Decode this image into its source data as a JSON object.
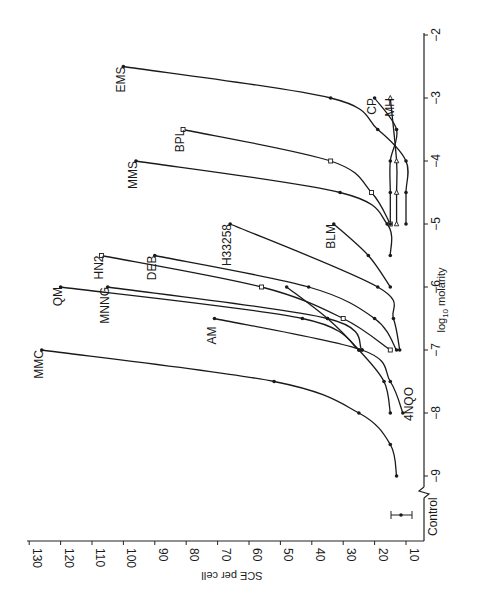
{
  "chart_data": {
    "type": "line",
    "orientation": "rotated-90-clockwise",
    "title": "",
    "xlabel": "log10 molarity",
    "ylabel": "SCE per cell",
    "xlim": [
      -9,
      -2
    ],
    "ylim": [
      0,
      130
    ],
    "x_ticks": [
      -9,
      -8,
      -7,
      -6,
      -5,
      -4,
      -3,
      -2
    ],
    "x_tick_labels": [
      "−9",
      "−8",
      "−7",
      "−6",
      "−5",
      "−4",
      "−3",
      "−2"
    ],
    "y_ticks": [
      10,
      20,
      30,
      40,
      50,
      60,
      70,
      80,
      90,
      100,
      110,
      120,
      130
    ],
    "y_tick_labels": [
      "10",
      "20",
      "30",
      "40",
      "50",
      "60",
      "70",
      "80",
      "90",
      "100",
      "110",
      "120",
      "130"
    ],
    "grid": false,
    "axis_break": "between Control and −9",
    "control": {
      "label": "Control",
      "value": 11.5,
      "error": 5
    },
    "series": [
      {
        "name": "MMC",
        "marker": "filled",
        "x": [
          -9,
          -8.5,
          -8,
          -7.5,
          -7
        ],
        "y": [
          13,
          15,
          25,
          52,
          126
        ]
      },
      {
        "name": "4NQO",
        "marker": "filled",
        "x": [
          -8,
          -7.5,
          -7,
          -6.5,
          -6
        ],
        "y": [
          15,
          17,
          25,
          35,
          48
        ]
      },
      {
        "name": "AM",
        "marker": "filled",
        "x": [
          -8,
          -7.5,
          -7,
          -6.5
        ],
        "y": [
          11,
          15,
          24,
          71
        ]
      },
      {
        "name": "QM",
        "marker": "filled",
        "x": [
          -7,
          -6.5,
          -6
        ],
        "y": [
          25,
          43,
          120
        ]
      },
      {
        "name": "MNNG",
        "marker": "filled",
        "x": [
          -7,
          -6.5,
          -6
        ],
        "y": [
          24,
          35,
          105
        ]
      },
      {
        "name": "HN2",
        "marker": "open-square",
        "x": [
          -7,
          -6.5,
          -6,
          -5.5
        ],
        "y": [
          15,
          30,
          56,
          107
        ]
      },
      {
        "name": "DEB",
        "marker": "filled",
        "x": [
          -7,
          -6.5,
          -6,
          -5.5
        ],
        "y": [
          13,
          20,
          41,
          90
        ]
      },
      {
        "name": "H33258",
        "marker": "filled",
        "x": [
          -7,
          -6.5,
          -6,
          -5
        ],
        "y": [
          12,
          14,
          19,
          66
        ]
      },
      {
        "name": "BLM",
        "marker": "filled",
        "x": [
          -6,
          -5.5,
          -5
        ],
        "y": [
          15,
          22,
          33
        ]
      },
      {
        "name": "MMS",
        "marker": "filled",
        "x": [
          -5.5,
          -5,
          -4.5,
          -4
        ],
        "y": [
          15,
          16,
          31,
          96
        ]
      },
      {
        "name": "BPL",
        "marker": "open-square",
        "x": [
          -5,
          -4.5,
          -4,
          -3.5
        ],
        "y": [
          15,
          21,
          34,
          81
        ]
      },
      {
        "name": "EMS",
        "marker": "filled",
        "x": [
          -5,
          -4.5,
          -4,
          -3.5,
          -3,
          -2.5
        ],
        "y": [
          10,
          10,
          10,
          19,
          34,
          100
        ]
      },
      {
        "name": "CP",
        "marker": "filled",
        "x": [
          -5,
          -4.5,
          -4,
          -3.5,
          -3
        ],
        "y": [
          15,
          15,
          15,
          13,
          20
        ]
      },
      {
        "name": "MH",
        "marker": "open-triangle",
        "x": [
          -5,
          -4.5,
          -4,
          -3
        ],
        "y": [
          13,
          13,
          13,
          15
        ]
      }
    ],
    "legend": "inline labels at curve ends"
  },
  "labels": {
    "xlabel_main": "molarity",
    "xlabel_prefix": "log",
    "xlabel_sub": "10",
    "ylabel": "SCE per cell",
    "control": "Control",
    "series": {
      "MMC": "MMC",
      "4NQO": "4NQO",
      "AM": "AM",
      "QM": "QM",
      "MNNG": "MNNG",
      "HN2": "HN2",
      "DEB": "DEB",
      "H33258": "H33258",
      "BLM": "BLM",
      "MMS": "MMS",
      "BPL": "BPL",
      "EMS": "EMS",
      "CP": "CP",
      "MH": "MH"
    }
  }
}
